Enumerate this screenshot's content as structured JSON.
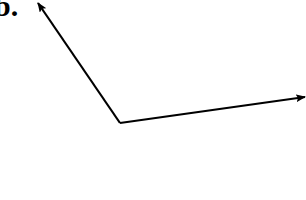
{
  "diagram": {
    "label": "b.",
    "stroke_color": "#000000",
    "background": "#ffffff",
    "origin": {
      "x": 120,
      "y": 123
    },
    "vectors": [
      {
        "name": "vector-up-left",
        "from": [
          120,
          123
        ],
        "to": [
          38,
          3
        ]
      },
      {
        "name": "vector-right",
        "from": [
          120,
          123
        ],
        "to": [
          305,
          97
        ]
      }
    ]
  }
}
